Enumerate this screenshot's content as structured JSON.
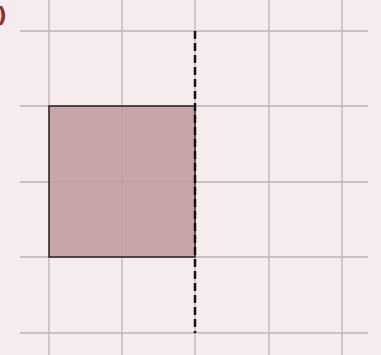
{
  "figure": {
    "label": ")",
    "label_color": "#9b2a2a",
    "background": "#f6eced",
    "grid": {
      "color": "#b9b4b5",
      "x_lines": [
        49,
        122,
        195,
        269,
        342
      ],
      "y_lines": [
        31,
        106,
        182,
        257,
        333
      ],
      "x_extent": [
        20,
        368
      ],
      "y_extent": [
        0,
        355
      ]
    },
    "shaded_square": {
      "x": 49,
      "y": 106,
      "width": 146,
      "height": 151,
      "fill": "#c29fa1",
      "stroke": "#2a1f20"
    },
    "dashed_line": {
      "x": 195,
      "y1": 31,
      "y2": 333,
      "color": "#111111",
      "dash": "8,4"
    }
  }
}
